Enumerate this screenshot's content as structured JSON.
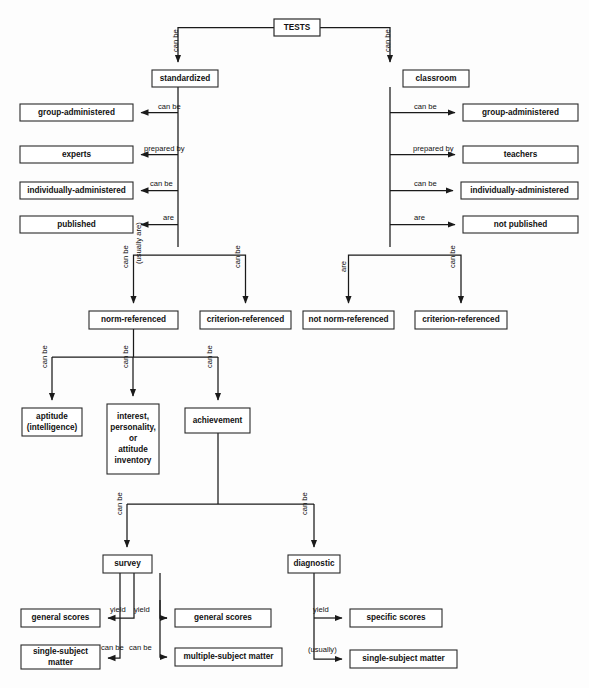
{
  "diagram": {
    "title": "TESTS",
    "type": "flowchart",
    "background_color": "#fdfdfd",
    "line_color": "#1a1a1a",
    "box_fill": "#ffffff",
    "box_stroke": "#2a2a2a"
  },
  "nodes": [
    {
      "id": "tests",
      "label": "TESTS",
      "x": 274,
      "y": 19,
      "w": 46,
      "h": 17
    },
    {
      "id": "standardized",
      "label": "standardized",
      "x": 152,
      "y": 70,
      "w": 66,
      "h": 17
    },
    {
      "id": "classroom",
      "label": "classroom",
      "x": 403,
      "y": 70,
      "w": 66,
      "h": 17
    },
    {
      "id": "l-group-admin",
      "label": "group-administered",
      "x": 20,
      "y": 104,
      "w": 113,
      "h": 17
    },
    {
      "id": "l-experts",
      "label": "experts",
      "x": 20,
      "y": 146,
      "w": 113,
      "h": 17
    },
    {
      "id": "l-indiv-admin",
      "label": "individually-administered",
      "x": 20,
      "y": 182,
      "w": 113,
      "h": 17
    },
    {
      "id": "l-published",
      "label": "published",
      "x": 20,
      "y": 216,
      "w": 113,
      "h": 17
    },
    {
      "id": "r-group-admin",
      "label": "group-administered",
      "x": 463,
      "y": 104,
      "w": 115,
      "h": 17
    },
    {
      "id": "r-teachers",
      "label": "teachers",
      "x": 463,
      "y": 146,
      "w": 115,
      "h": 17
    },
    {
      "id": "r-indiv-admin",
      "label": "individually-administered",
      "x": 461,
      "y": 182,
      "w": 117,
      "h": 17
    },
    {
      "id": "r-not-published",
      "label": "not published",
      "x": 463,
      "y": 216,
      "w": 115,
      "h": 17
    },
    {
      "id": "norm-ref",
      "label": "norm-referenced",
      "x": 89,
      "y": 311,
      "w": 89,
      "h": 18
    },
    {
      "id": "crit-ref-std",
      "label": "criterion-referenced",
      "x": 200,
      "y": 311,
      "w": 91,
      "h": 18
    },
    {
      "id": "not-norm-ref",
      "label": "not norm-referenced",
      "x": 303,
      "y": 311,
      "w": 91,
      "h": 18
    },
    {
      "id": "crit-ref-class",
      "label": "criterion-referenced",
      "x": 415,
      "y": 311,
      "w": 92,
      "h": 18
    },
    {
      "id": "aptitude",
      "label": "aptitude|(intelligence)",
      "x": 22,
      "y": 408,
      "w": 60,
      "h": 28
    },
    {
      "id": "inventory",
      "label": "interest,|personality,|or|attitude|inventory",
      "x": 107,
      "y": 404,
      "w": 52,
      "h": 70
    },
    {
      "id": "achievement",
      "label": "achievement",
      "x": 185,
      "y": 408,
      "w": 65,
      "h": 25
    },
    {
      "id": "survey",
      "label": "survey",
      "x": 103,
      "y": 555,
      "w": 49,
      "h": 18
    },
    {
      "id": "diagnostic",
      "label": "diagnostic",
      "x": 288,
      "y": 555,
      "w": 52,
      "h": 18
    },
    {
      "id": "s-general-left",
      "label": "general scores",
      "x": 21,
      "y": 609,
      "w": 79,
      "h": 18
    },
    {
      "id": "s-single-left",
      "label": "single-subject|matter",
      "x": 21,
      "y": 645,
      "w": 79,
      "h": 24
    },
    {
      "id": "s-general-right",
      "label": "general scores",
      "x": 175,
      "y": 609,
      "w": 96,
      "h": 18
    },
    {
      "id": "s-multiple",
      "label": "multiple-subject matter",
      "x": 175,
      "y": 648,
      "w": 107,
      "h": 18
    },
    {
      "id": "d-specific",
      "label": "specific scores",
      "x": 350,
      "y": 609,
      "w": 92,
      "h": 18
    },
    {
      "id": "d-single",
      "label": "single-subject matter",
      "x": 350,
      "y": 650,
      "w": 107,
      "h": 18
    }
  ],
  "edge_labels": [
    {
      "id": "e1",
      "text": "can be",
      "x": 178,
      "y": 52,
      "orient": "vertical"
    },
    {
      "id": "e2",
      "text": "can be",
      "x": 390,
      "y": 52,
      "orient": "vertical"
    },
    {
      "id": "e3",
      "text": "can be",
      "x": 158,
      "y": 109,
      "orient": "horizontal"
    },
    {
      "id": "e4",
      "text": "prepared by",
      "x": 144,
      "y": 151,
      "orient": "horizontal"
    },
    {
      "id": "e5",
      "text": "can be",
      "x": 150,
      "y": 186,
      "orient": "horizontal"
    },
    {
      "id": "e6",
      "text": "are",
      "x": 163,
      "y": 220,
      "orient": "horizontal"
    },
    {
      "id": "e7",
      "text": "can be",
      "x": 414,
      "y": 109,
      "orient": "horizontal"
    },
    {
      "id": "e8",
      "text": "prepared by",
      "x": 413,
      "y": 151,
      "orient": "horizontal"
    },
    {
      "id": "e9",
      "text": "can be",
      "x": 414,
      "y": 186,
      "orient": "horizontal"
    },
    {
      "id": "e10",
      "text": "are",
      "x": 414,
      "y": 220,
      "orient": "horizontal"
    },
    {
      "id": "e11",
      "text": "can be",
      "x": 128,
      "y": 268,
      "orient": "vertical"
    },
    {
      "id": "e12",
      "text": "(usually are)",
      "x": 141,
      "y": 264,
      "orient": "vertical"
    },
    {
      "id": "e13",
      "text": "can be",
      "x": 240,
      "y": 268,
      "orient": "vertical"
    },
    {
      "id": "e14",
      "text": "are",
      "x": 346,
      "y": 272,
      "orient": "vertical"
    },
    {
      "id": "e15",
      "text": "can be",
      "x": 455,
      "y": 268,
      "orient": "vertical"
    },
    {
      "id": "e16",
      "text": "can be",
      "x": 47,
      "y": 368,
      "orient": "vertical"
    },
    {
      "id": "e17",
      "text": "can be",
      "x": 128,
      "y": 368,
      "orient": "vertical"
    },
    {
      "id": "e18",
      "text": "can be",
      "x": 212,
      "y": 368,
      "orient": "vertical"
    },
    {
      "id": "e19",
      "text": "can be",
      "x": 122,
      "y": 515,
      "orient": "vertical"
    },
    {
      "id": "e20",
      "text": "can be",
      "x": 307,
      "y": 515,
      "orient": "vertical"
    },
    {
      "id": "e21",
      "text": "yield",
      "x": 110,
      "y": 612,
      "orient": "horizontal"
    },
    {
      "id": "e22",
      "text": "can be",
      "x": 101,
      "y": 650,
      "orient": "horizontal"
    },
    {
      "id": "e23",
      "text": "yield",
      "x": 134,
      "y": 612,
      "orient": "horizontal"
    },
    {
      "id": "e24",
      "text": "can be",
      "x": 129,
      "y": 650,
      "orient": "horizontal"
    },
    {
      "id": "e25",
      "text": "yield",
      "x": 313,
      "y": 612,
      "orient": "horizontal"
    },
    {
      "id": "e26",
      "text": "(usually)",
      "x": 308,
      "y": 652,
      "orient": "horizontal"
    }
  ]
}
